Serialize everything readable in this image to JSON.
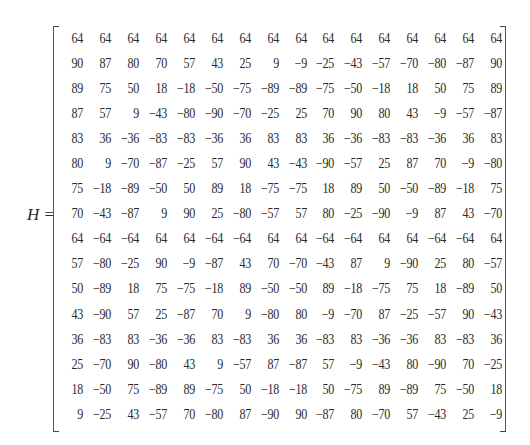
{
  "equation": {
    "lhs_symbol": "H",
    "equals": "=",
    "rows": 16,
    "cols": 16
  },
  "matrix": [
    [
      "64",
      "64",
      "64",
      "64",
      "64",
      "64",
      "64",
      "64",
      "64",
      "64",
      "64",
      "64",
      "64",
      "64",
      "64",
      "64"
    ],
    [
      "90",
      "87",
      "80",
      "70",
      "57",
      "43",
      "25",
      "9",
      "−9",
      "−25",
      "−43",
      "−57",
      "−70",
      "−80",
      "−87",
      "90"
    ],
    [
      "89",
      "75",
      "50",
      "18",
      "−18",
      "−50",
      "−75",
      "−89",
      "−89",
      "−75",
      "−50",
      "−18",
      "18",
      "50",
      "75",
      "89"
    ],
    [
      "87",
      "57",
      "9",
      "−43",
      "−80",
      "−90",
      "−70",
      "−25",
      "25",
      "70",
      "90",
      "80",
      "43",
      "−9",
      "−57",
      "−87"
    ],
    [
      "83",
      "36",
      "−36",
      "−83",
      "−83",
      "−36",
      "36",
      "83",
      "83",
      "36",
      "−36",
      "−83",
      "−83",
      "−36",
      "36",
      "83"
    ],
    [
      "80",
      "9",
      "−70",
      "−87",
      "−25",
      "57",
      "90",
      "43",
      "−43",
      "−90",
      "−57",
      "25",
      "87",
      "70",
      "−9",
      "−80"
    ],
    [
      "75",
      "−18",
      "−89",
      "−50",
      "50",
      "89",
      "18",
      "−75",
      "−75",
      "18",
      "89",
      "50",
      "−50",
      "−89",
      "−18",
      "75"
    ],
    [
      "70",
      "−43",
      "−87",
      "9",
      "90",
      "25",
      "−80",
      "−57",
      "57",
      "80",
      "−25",
      "−90",
      "−9",
      "87",
      "43",
      "−70"
    ],
    [
      "64",
      "−64",
      "−64",
      "64",
      "64",
      "−64",
      "−64",
      "64",
      "64",
      "−64",
      "−64",
      "64",
      "64",
      "−64",
      "−64",
      "64"
    ],
    [
      "57",
      "−80",
      "−25",
      "90",
      "−9",
      "−87",
      "43",
      "70",
      "−70",
      "−43",
      "87",
      "9",
      "−90",
      "25",
      "80",
      "−57"
    ],
    [
      "50",
      "−89",
      "18",
      "75",
      "−75",
      "−18",
      "89",
      "−50",
      "−50",
      "89",
      "−18",
      "−75",
      "75",
      "18",
      "−89",
      "50"
    ],
    [
      "43",
      "−90",
      "57",
      "25",
      "−87",
      "70",
      "9",
      "−80",
      "80",
      "−9",
      "−70",
      "87",
      "−25",
      "−57",
      "90",
      "−43"
    ],
    [
      "36",
      "−83",
      "83",
      "−36",
      "−36",
      "83",
      "−83",
      "36",
      "36",
      "−83",
      "83",
      "−36",
      "−36",
      "83",
      "−83",
      "36"
    ],
    [
      "25",
      "−70",
      "90",
      "−80",
      "43",
      "9",
      "−57",
      "87",
      "−87",
      "57",
      "−9",
      "−43",
      "80",
      "−90",
      "70",
      "−25"
    ],
    [
      "18",
      "−50",
      "75",
      "−89",
      "89",
      "−75",
      "50",
      "−18",
      "−18",
      "50",
      "−75",
      "89",
      "−89",
      "75",
      "−50",
      "18"
    ],
    [
      "9",
      "−25",
      "43",
      "−57",
      "70",
      "−80",
      "87",
      "−90",
      "90",
      "−87",
      "80",
      "−70",
      "57",
      "−43",
      "25",
      "−9"
    ]
  ]
}
